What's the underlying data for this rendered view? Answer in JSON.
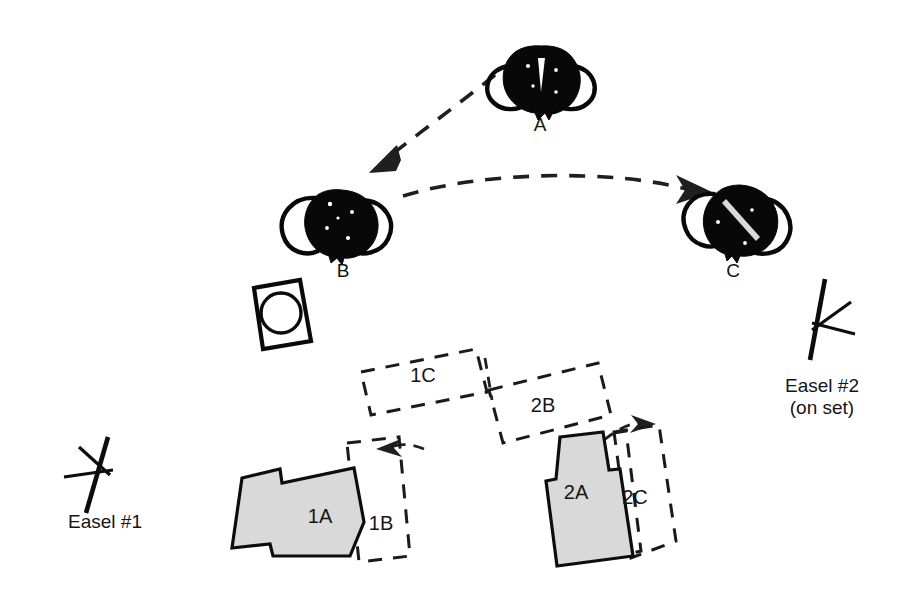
{
  "diagram": {
    "background_color": "#ffffff",
    "ink_color": "#0d0d0d",
    "fill_gray": "#d9d9d9",
    "people": [
      {
        "id": "person-a",
        "label": "A",
        "label_x": 540,
        "label_y": 131,
        "cx": 541,
        "cy": 82
      },
      {
        "id": "person-b",
        "label": "B",
        "label_x": 343,
        "label_y": 277,
        "cx": 341,
        "cy": 227
      },
      {
        "id": "person-c",
        "label": "C",
        "label_x": 733,
        "label_y": 277,
        "cx": 739,
        "cy": 222
      }
    ],
    "easels": [
      {
        "id": "easel-1",
        "label": "Easel #1",
        "sublabel": "",
        "label_x": 105,
        "label_y": 528
      },
      {
        "id": "easel-2",
        "label": "Easel #2",
        "sublabel": "(on set)",
        "label_x": 822,
        "label_y": 392,
        "sublabel_x": 822,
        "sublabel_y": 414
      }
    ],
    "camera": {
      "id": "camera-monitor",
      "x": 252,
      "y": 281
    },
    "shapes": [
      {
        "id": "shape-1a",
        "label": "1A",
        "style": "solid",
        "label_x": 320,
        "label_y": 523
      },
      {
        "id": "shape-1b",
        "label": "1B",
        "style": "dashed",
        "label_x": 381,
        "label_y": 530
      },
      {
        "id": "shape-1c",
        "label": "1C",
        "style": "dashed",
        "label_x": 423,
        "label_y": 382
      },
      {
        "id": "shape-2a",
        "label": "2A",
        "style": "solid",
        "label_x": 576,
        "label_y": 499
      },
      {
        "id": "shape-2b",
        "label": "2B",
        "style": "dashed",
        "label_x": 543,
        "label_y": 412
      },
      {
        "id": "shape-2c",
        "label": "2C",
        "style": "dashed",
        "label_x": 635,
        "label_y": 504
      }
    ],
    "arrows": [
      {
        "id": "arrow-a-to-b",
        "from": "A",
        "to": "B",
        "style": "dashed-curve"
      },
      {
        "id": "arrow-b-to-c",
        "from": "B",
        "to": "C",
        "style": "dashed-curve"
      },
      {
        "id": "arrow-into-1b",
        "from": "1A",
        "to": "1B",
        "style": "short-curve"
      },
      {
        "id": "arrow-into-2c",
        "from": "2B",
        "to": "2C",
        "style": "short-curve"
      }
    ]
  }
}
